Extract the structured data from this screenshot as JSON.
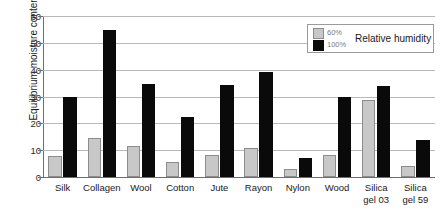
{
  "chart_data": {
    "type": "bar",
    "title": "",
    "xlabel": "",
    "ylabel": "Equilibrium moisture content",
    "ylim": [
      0,
      60
    ],
    "yticks": [
      0,
      10,
      20,
      30,
      40,
      50,
      60
    ],
    "ytick_labels": [
      "0",
      "10",
      "20",
      "30",
      "40",
      "50",
      "60"
    ],
    "grid": true,
    "legend_position": "top-right",
    "legend_title": "Relative humidity",
    "categories": [
      "Silk",
      "Collagen",
      "Wool",
      "Cotton",
      "Jute",
      "Rayon",
      "Nylon",
      "Wood",
      "Silica gel 03",
      "Silica gel 59"
    ],
    "category_lines": [
      [
        "Silk",
        ""
      ],
      [
        "Collagen",
        ""
      ],
      [
        "Wool",
        ""
      ],
      [
        "Cotton",
        ""
      ],
      [
        "Jute",
        ""
      ],
      [
        "Rayon",
        ""
      ],
      [
        "Nylon",
        ""
      ],
      [
        "Wood",
        ""
      ],
      [
        "Silica",
        "gel 03"
      ],
      [
        "Silica",
        "gel 59"
      ]
    ],
    "series": [
      {
        "name": "60%",
        "color": "#c8c8c8",
        "values": [
          7.8,
          14.6,
          11.7,
          5.6,
          8.1,
          10.9,
          3.0,
          8.1,
          28.7,
          4.2
        ]
      },
      {
        "name": "100%",
        "color": "#0a0a0a",
        "values": [
          29.8,
          54.7,
          34.6,
          22.4,
          34.3,
          39.3,
          7.2,
          30.0,
          33.8,
          13.9
        ]
      }
    ]
  },
  "legend": {
    "title": "Relative humidity",
    "entries": [
      {
        "label": "60%",
        "swatch": "gray-swatch-icon"
      },
      {
        "label": "100%",
        "swatch": "black-swatch-icon"
      }
    ]
  },
  "axes": {
    "y_title": "Equilibrium moisture content"
  }
}
